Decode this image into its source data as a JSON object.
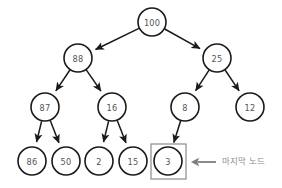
{
  "diagram": {
    "type": "tree",
    "colors": {
      "node_stroke": "#1a1a1a",
      "node_fill": "#ffffff",
      "node_text": "#555555",
      "edge": "#1a1a1a",
      "highlight_box_stroke": "#8a8a8a",
      "annotation": "#8d8d8d",
      "background": "#ffffff"
    },
    "nodes": [
      {
        "id": "n100",
        "label": "100",
        "cx": 152,
        "cy": 22,
        "r": 14,
        "level": 0,
        "highlighted": false
      },
      {
        "id": "n88",
        "label": "88",
        "cx": 78,
        "cy": 58,
        "r": 14,
        "level": 1,
        "highlighted": false
      },
      {
        "id": "n25",
        "label": "25",
        "cx": 217,
        "cy": 58,
        "r": 14,
        "level": 1,
        "highlighted": false
      },
      {
        "id": "n87",
        "label": "87",
        "cx": 45,
        "cy": 107,
        "r": 14,
        "level": 2,
        "highlighted": false
      },
      {
        "id": "n16",
        "label": "16",
        "cx": 112,
        "cy": 107,
        "r": 14,
        "level": 2,
        "highlighted": false
      },
      {
        "id": "n8",
        "label": "8",
        "cx": 185,
        "cy": 107,
        "r": 14,
        "level": 2,
        "highlighted": false
      },
      {
        "id": "n12",
        "label": "12",
        "cx": 250,
        "cy": 107,
        "r": 14,
        "level": 2,
        "highlighted": false
      },
      {
        "id": "n86",
        "label": "86",
        "cx": 32,
        "cy": 161,
        "r": 14,
        "level": 3,
        "highlighted": false
      },
      {
        "id": "n50",
        "label": "50",
        "cx": 66,
        "cy": 161,
        "r": 14,
        "level": 3,
        "highlighted": false
      },
      {
        "id": "n2",
        "label": "2",
        "cx": 99,
        "cy": 161,
        "r": 14,
        "level": 3,
        "highlighted": false
      },
      {
        "id": "n15",
        "label": "15",
        "cx": 133,
        "cy": 161,
        "r": 14,
        "level": 3,
        "highlighted": false
      },
      {
        "id": "n3",
        "label": "3",
        "cx": 168,
        "cy": 161,
        "r": 14,
        "level": 3,
        "highlighted": true
      }
    ],
    "edges": [
      {
        "from": "n100",
        "to": "n88",
        "arrow": true
      },
      {
        "from": "n100",
        "to": "n25",
        "arrow": true
      },
      {
        "from": "n88",
        "to": "n87",
        "arrow": true
      },
      {
        "from": "n88",
        "to": "n16",
        "arrow": true
      },
      {
        "from": "n25",
        "to": "n8",
        "arrow": true
      },
      {
        "from": "n25",
        "to": "n12",
        "arrow": true
      },
      {
        "from": "n87",
        "to": "n86",
        "arrow": true
      },
      {
        "from": "n87",
        "to": "n50",
        "arrow": true
      },
      {
        "from": "n16",
        "to": "n2",
        "arrow": true
      },
      {
        "from": "n16",
        "to": "n15",
        "arrow": true
      },
      {
        "from": "n8",
        "to": "n3",
        "arrow": true
      }
    ],
    "highlight_box": {
      "target": "n3",
      "x": 151,
      "y": 144,
      "width": 35,
      "height": 35
    },
    "annotation": {
      "text": "마지막 노드",
      "arrow": {
        "x_tail": 216,
        "x_head": 191,
        "y": 162,
        "direction": "left"
      },
      "text_x": 222,
      "text_y": 157
    }
  }
}
